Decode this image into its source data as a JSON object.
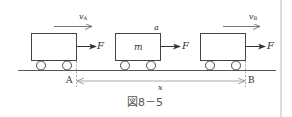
{
  "figure": {
    "caption": "図8－5",
    "carts": [
      {
        "id": "cart-at-A",
        "velocity_label": "v",
        "velocity_sub": "A",
        "force_label": "F",
        "mass_label": ""
      },
      {
        "id": "cart-middle",
        "velocity_label": "",
        "velocity_sub": "",
        "acceleration_label": "a",
        "force_label": "F",
        "mass_label": "m"
      },
      {
        "id": "cart-at-B",
        "velocity_label": "v",
        "velocity_sub": "B",
        "force_label": "F",
        "mass_label": ""
      }
    ],
    "points": {
      "start": "A",
      "end": "B"
    },
    "distance_label": "x"
  },
  "colors": {
    "line": "#444444",
    "light_line": "#888888",
    "border": "#bbbbbb",
    "text": "#333333"
  }
}
